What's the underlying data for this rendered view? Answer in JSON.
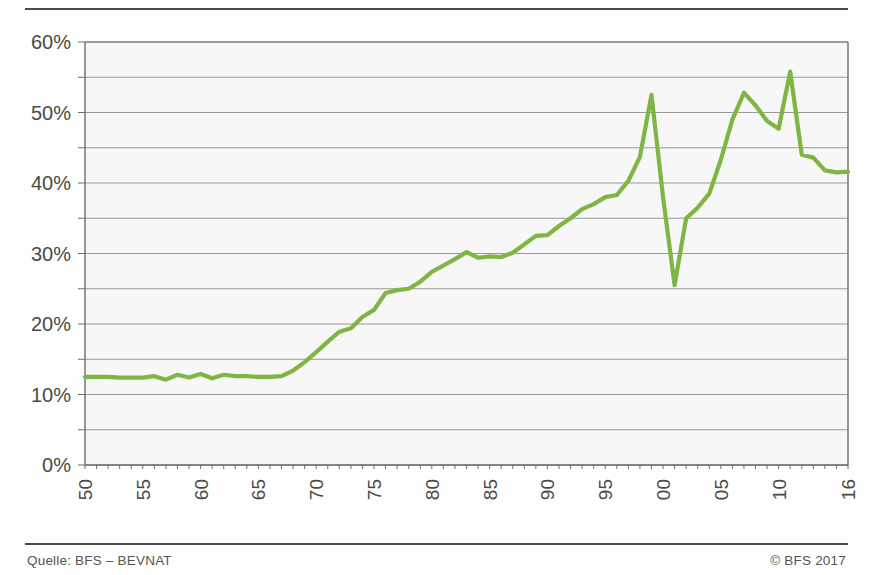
{
  "figure": {
    "source_note": "Quelle: BFS – BEVNAT",
    "copyright": "© BFS 2017"
  },
  "colors": {
    "series": "#7fb542",
    "gridline": "#8a8a82",
    "axis": "#6e6e66",
    "rule": "#4a4a46",
    "plot_background": "#eef1ee",
    "text": "#4a4a46"
  },
  "chart_data": {
    "type": "line",
    "title": "",
    "subtitle": "",
    "xlabel": "",
    "ylabel": "",
    "xlim": [
      1950,
      2016
    ],
    "ylim": [
      0,
      60
    ],
    "ytick_step": 10,
    "ygrid_step": 5,
    "grid": true,
    "legend": "none",
    "y_unit": "%",
    "y_tick_labels": [
      "0%",
      "10%",
      "20%",
      "30%",
      "40%",
      "50%",
      "60%"
    ],
    "y_ticks": [
      0,
      10,
      20,
      30,
      40,
      50,
      60
    ],
    "y_gridlines": [
      0,
      5,
      10,
      15,
      20,
      25,
      30,
      35,
      40,
      45,
      50,
      55,
      60
    ],
    "x_tick_labels": [
      "1950",
      "1955",
      "1960",
      "1965",
      "1970",
      "1975",
      "1980",
      "1985",
      "1990",
      "1995",
      "2000",
      "2005",
      "2010",
      "2016"
    ],
    "x_ticks": [
      1950,
      1955,
      1960,
      1965,
      1970,
      1975,
      1980,
      1985,
      1990,
      1995,
      2000,
      2005,
      2010,
      2016
    ],
    "series_name": "Anteil",
    "x": [
      1950,
      1951,
      1952,
      1953,
      1954,
      1955,
      1956,
      1957,
      1958,
      1959,
      1960,
      1961,
      1962,
      1963,
      1964,
      1965,
      1966,
      1967,
      1968,
      1969,
      1970,
      1971,
      1972,
      1973,
      1974,
      1975,
      1976,
      1977,
      1978,
      1979,
      1980,
      1981,
      1982,
      1983,
      1984,
      1985,
      1986,
      1987,
      1988,
      1989,
      1990,
      1991,
      1992,
      1993,
      1994,
      1995,
      1996,
      1997,
      1998,
      1999,
      2000,
      2001,
      2002,
      2003,
      2004,
      2005,
      2006,
      2007,
      2008,
      2009,
      2010,
      2011,
      2012,
      2013,
      2014,
      2015,
      2016
    ],
    "values": [
      12.5,
      12.5,
      12.5,
      12.4,
      12.4,
      12.4,
      12.6,
      12.1,
      12.8,
      12.4,
      12.9,
      12.3,
      12.8,
      12.6,
      12.6,
      12.5,
      12.5,
      12.6,
      13.4,
      14.6,
      16.0,
      17.5,
      18.9,
      19.4,
      21.0,
      22.0,
      24.4,
      24.8,
      25.0,
      26.0,
      27.4,
      28.3,
      29.2,
      30.2,
      29.4,
      29.6,
      29.5,
      30.1,
      31.3,
      32.5,
      32.6,
      33.9,
      35.0,
      36.3,
      37.0,
      38.0,
      38.3,
      40.3,
      43.7,
      52.5,
      38.0,
      25.5,
      35.0,
      36.5,
      38.5,
      43.3,
      49.0,
      52.8,
      51.0,
      48.8,
      47.7,
      55.8,
      44.0,
      43.6,
      41.8,
      41.5,
      41.6
    ]
  }
}
